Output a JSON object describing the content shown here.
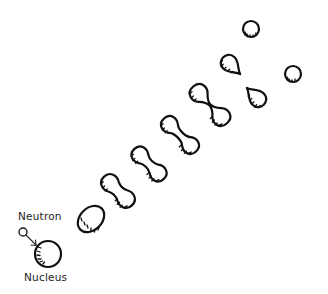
{
  "diagram": {
    "labels": {
      "neutron": "Neutron",
      "nucleus": "Nucleus"
    },
    "colors": {
      "ink": "#111111",
      "background": "#ffffff"
    },
    "stages": [
      {
        "id": "nucleus",
        "shape": "circle",
        "cx": 48,
        "cy": 254,
        "r": 13
      },
      {
        "id": "elongated",
        "shape": "ellipse",
        "cx": 91,
        "cy": 219,
        "rx": 15,
        "ry": 11,
        "rotate": -45
      },
      {
        "id": "peanut-1",
        "shape": "peanut",
        "cx": 118,
        "cy": 191
      },
      {
        "id": "peanut-2",
        "shape": "peanut",
        "cx": 149,
        "cy": 164
      },
      {
        "id": "peanut-3",
        "shape": "peanut",
        "cx": 180,
        "cy": 135
      },
      {
        "id": "figure-eight",
        "shape": "figure-eight",
        "cx": 210,
        "cy": 105
      },
      {
        "id": "fragment-a",
        "shape": "teardrop",
        "cx": 231,
        "cy": 65
      },
      {
        "id": "fragment-b",
        "shape": "teardrop",
        "cx": 256,
        "cy": 97
      },
      {
        "id": "product-a",
        "shape": "circle",
        "cx": 251,
        "cy": 29,
        "r": 8
      },
      {
        "id": "product-b",
        "shape": "circle",
        "cx": 293,
        "cy": 74,
        "r": 8
      }
    ],
    "neutron": {
      "cx": 23,
      "cy": 232,
      "r": 4
    }
  }
}
